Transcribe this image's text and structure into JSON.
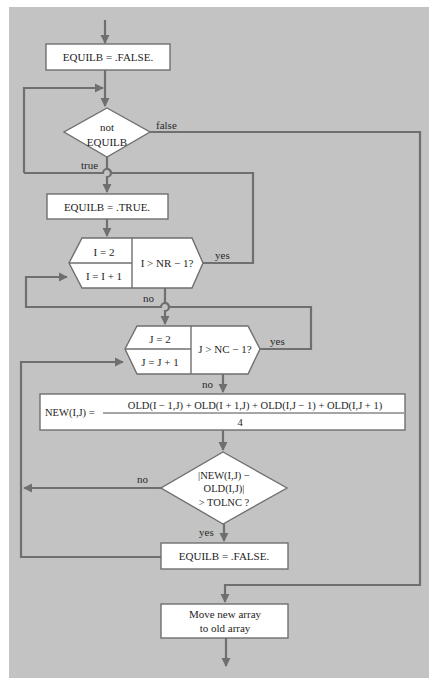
{
  "colors": {
    "background": "#c3c3c3",
    "line": "#6f6f6f",
    "box_fill": "#ffffff",
    "box_stroke": "#6f6f6f",
    "text": "#1e1e1e"
  },
  "nodes": {
    "init": {
      "label": "EQUILB = .FALSE."
    },
    "while_decision": {
      "line1": "not",
      "line2": "EQUILB"
    },
    "set_true": {
      "label": "EQUILB = .TRUE."
    },
    "i_loop": {
      "init": "I = 2",
      "increment": "I = I + 1",
      "test": "I > NR − 1?"
    },
    "j_loop": {
      "init": "J = 2",
      "increment": "J = J + 1",
      "test": "J > NC − 1?"
    },
    "update": {
      "lhs": "NEW(I,J) =",
      "numerator": "OLD(I − 1,J) + OLD(I + 1,J) + OLD(I,J − 1) + OLD(I,J + 1)",
      "denominator": "4"
    },
    "tolerance_decision": {
      "line1": "|NEW(I,J) −",
      "line2": "OLD(I,J)|",
      "line3": "> TOLNC ?"
    },
    "set_false": {
      "label": "EQUILB = .FALSE."
    },
    "move_array": {
      "line1": "Move new array",
      "line2": "to old array"
    }
  },
  "edges": {
    "while_false": "false",
    "while_true": "true",
    "i_yes": "yes",
    "i_no": "no",
    "j_yes": "yes",
    "j_no": "no",
    "tol_no": "no",
    "tol_yes": "yes"
  }
}
